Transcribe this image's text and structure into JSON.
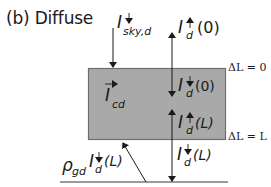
{
  "title": "(b) Diffuse",
  "colors": {
    "layer_fill": "#a9a9a9",
    "layer_border": "#6e6e6e",
    "ground_line": "#7a7a7a",
    "arrow": "#1a1a1a",
    "text": "#1a1a1a"
  },
  "layer": {
    "top_label": "ΔL = 0",
    "bottom_label": "ΔL = L"
  },
  "fluxes": {
    "sky_down": {
      "symbol": "I",
      "direction": "down",
      "subscript": "sky,d"
    },
    "up_top": {
      "symbol": "I",
      "direction": "up",
      "subscript": "d",
      "arg": "(0)"
    },
    "down_top_inside": {
      "symbol": "I",
      "direction": "down",
      "subscript": "d",
      "arg": "(0)"
    },
    "canopy_vector": {
      "symbol": "I",
      "overarrow": "right",
      "subscript": "cd"
    },
    "up_bottom_inside": {
      "symbol": "I",
      "direction": "up",
      "subscript": "d",
      "arg": "(L)"
    },
    "down_bottom": {
      "symbol": "I",
      "direction": "down",
      "subscript": "d",
      "arg": "(L)"
    },
    "ground_reflect": {
      "coef": "ρ",
      "coef_subscript": "gd",
      "symbol": "I",
      "direction": "down",
      "subscript": "d",
      "arg": "(L)"
    }
  }
}
